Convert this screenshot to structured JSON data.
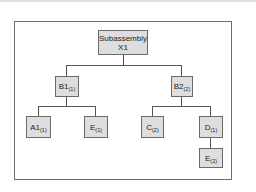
{
  "diagram": {
    "type": "tree",
    "root": {
      "id": "x1",
      "line1": "Subassembly",
      "line2": "X1"
    },
    "nodes": [
      {
        "id": "b1",
        "label": "B1",
        "qty": "(1)",
        "parent": "x1"
      },
      {
        "id": "b2",
        "label": "B2",
        "qty": "(2)",
        "parent": "x1"
      },
      {
        "id": "a1",
        "label": "A1",
        "qty": "(1)",
        "parent": "b1"
      },
      {
        "id": "e1",
        "label": "E",
        "qty": "(1)",
        "parent": "b1"
      },
      {
        "id": "c2",
        "label": "C",
        "qty": "(2)",
        "parent": "b2"
      },
      {
        "id": "d1",
        "label": "D",
        "qty": "(1)",
        "parent": "b2"
      },
      {
        "id": "e2",
        "label": "E",
        "qty": "(2)",
        "parent": "d1"
      }
    ],
    "colors": {
      "node_fill": "#dedede",
      "node_border": "#6a6a6a",
      "connector": "#555555",
      "frame_border": "#6e6e6e"
    }
  }
}
